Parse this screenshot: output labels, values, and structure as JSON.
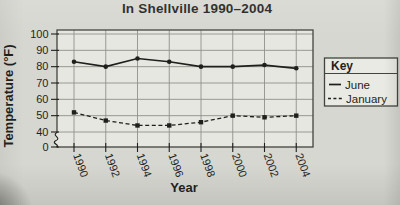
{
  "title": "In Shellville 1990–2004",
  "key": {
    "title": "Key"
  },
  "chart_data": {
    "type": "line",
    "title": "In Shellville 1990–2004",
    "xlabel": "Year",
    "ylabel": "Temperature (°F)",
    "x": [
      1990,
      1992,
      1994,
      1996,
      1998,
      2000,
      2002,
      2004
    ],
    "series": [
      {
        "name": "June",
        "style": "solid",
        "marker": "circle",
        "values": [
          83,
          80,
          85,
          83,
          80,
          80,
          81,
          79
        ]
      },
      {
        "name": "January",
        "style": "dashed",
        "marker": "square",
        "values": [
          52,
          47,
          44,
          44,
          46,
          50,
          49,
          50
        ]
      }
    ],
    "y_ticks": [
      0,
      40,
      50,
      60,
      70,
      80,
      90,
      100
    ],
    "ylim": [
      0,
      100
    ],
    "axis_break_between": [
      0,
      40
    ],
    "grid": true,
    "legend_position": "right",
    "x_tick_rotation_deg": 70
  },
  "colors": {
    "paper": "#d6d7d1",
    "plot_bg": "#e6e7e1",
    "grid": "#90918a",
    "border": "#44443e",
    "ink": "#1f1f1d",
    "legend_bg": "#e9eae4"
  }
}
